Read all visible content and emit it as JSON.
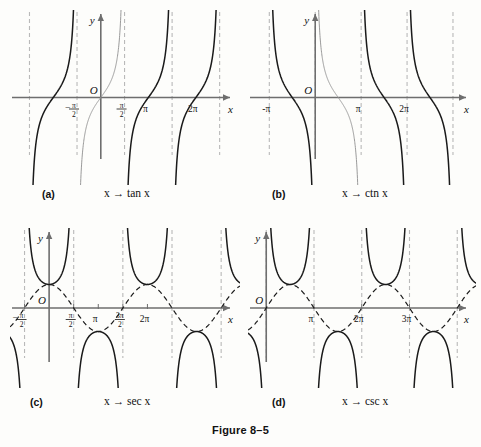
{
  "figure": {
    "title": "Figure 8–5",
    "width": 481,
    "height": 447,
    "background": "#fdfdfb",
    "curve_color": "#1a1a1a",
    "axis_color": "#6e6e6e",
    "asymptote_color": "#b9b9b9",
    "faint_curve_color": "#9a9a9a"
  },
  "panels": [
    {
      "id": "a",
      "caption": "(a)",
      "function_label": "x → tan x",
      "function_name": "tan",
      "origin_label": "O",
      "y_axis_label": "y",
      "x_axis_label": "x",
      "x_ticks": [
        {
          "label": "-π/2",
          "num": "π",
          "den": "2",
          "sign": "−",
          "value": -1.5708
        },
        {
          "label": "π/2",
          "num": "π",
          "den": "2",
          "sign": "",
          "value": 1.5708
        },
        {
          "label": "π",
          "value": 3.1416
        },
        {
          "label": "2π",
          "value": 6.2832
        }
      ],
      "asymptotes": [
        -4.7124,
        -1.5708,
        1.5708,
        4.7124,
        7.854
      ],
      "branch_centers": [
        -3.1416,
        0,
        3.1416,
        6.2832
      ],
      "x_range": [
        -6.0,
        9.2
      ],
      "y_range": [
        -4.2,
        4.2
      ]
    },
    {
      "id": "b",
      "caption": "(b)",
      "function_label": "x → ctn x",
      "function_name": "ctn",
      "origin_label": "O",
      "y_axis_label": "y",
      "x_axis_label": "x",
      "x_ticks": [
        {
          "label": "-π",
          "value": -3.1416
        },
        {
          "label": "π",
          "value": 3.1416
        },
        {
          "label": "2π",
          "value": 6.2832
        }
      ],
      "asymptotes": [
        -3.1416,
        0,
        3.1416,
        6.2832,
        9.4248
      ],
      "branch_centers": [
        -1.5708,
        1.5708,
        4.7124,
        7.854
      ],
      "x_range": [
        -4.6,
        11.0
      ],
      "y_range": [
        -4.2,
        4.2
      ]
    },
    {
      "id": "c",
      "caption": "(c)",
      "function_label": "x → sec x",
      "function_name": "sec",
      "origin_label": "O",
      "y_axis_label": "y",
      "x_axis_label": "x",
      "x_ticks": [
        {
          "label": "-π/2",
          "num": "π",
          "den": "2",
          "sign": "−",
          "value": -1.5708
        },
        {
          "label": "π/2",
          "num": "π",
          "den": "2",
          "sign": "",
          "value": 1.5708
        },
        {
          "label": "π",
          "value": 3.1416
        },
        {
          "label": "3π/2",
          "num": "3π",
          "den": "2",
          "sign": "",
          "value": 4.7124
        },
        {
          "label": "2π",
          "value": 6.2832
        }
      ],
      "asymptotes": [
        -1.5708,
        1.5708,
        4.7124,
        7.854,
        10.9956
      ],
      "guide_curve": "cosine",
      "x_range": [
        -2.5,
        12.2
      ],
      "y_range": [
        -3.4,
        3.4
      ]
    },
    {
      "id": "d",
      "caption": "(d)",
      "function_label": "x → csc x",
      "function_name": "csc",
      "origin_label": "O",
      "y_axis_label": "y",
      "x_axis_label": "x",
      "x_ticks": [
        {
          "label": "π",
          "value": 3.1416
        },
        {
          "label": "2π",
          "value": 6.2832
        },
        {
          "label": "3π",
          "value": 9.4248
        }
      ],
      "asymptotes": [
        0,
        3.1416,
        6.2832,
        9.4248,
        12.5664
      ],
      "guide_curve": "sine",
      "x_range": [
        -1.2,
        13.8
      ],
      "y_range": [
        -3.4,
        3.4
      ]
    }
  ]
}
